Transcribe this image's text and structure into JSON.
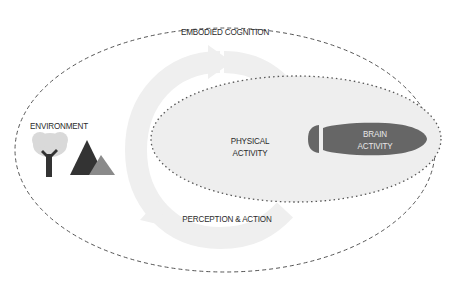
{
  "diagram": {
    "outer_label": "EMBODIED COGNITION",
    "environment_label": "ENVIRONMENT",
    "physical_label_line1": "PHYSICAL",
    "physical_label_line2": "ACTIVITY",
    "brain_label_line1": "BRAIN",
    "brain_label_line2": "ACTIVITY",
    "loop_label": "PERCEPTION & ACTION",
    "icons": [
      "tree-icon",
      "mountains-icon",
      "cycle-arrow-icon"
    ],
    "colors": {
      "outline": "#555555",
      "physical_fill": "#eeeeee",
      "brain_fill": "#666666",
      "arrow": "#efefef",
      "tree_top": "#d9d9d9",
      "tree_trunk": "#333333",
      "mountain_dark": "#333333",
      "mountain_light": "#8a8a8a"
    }
  }
}
